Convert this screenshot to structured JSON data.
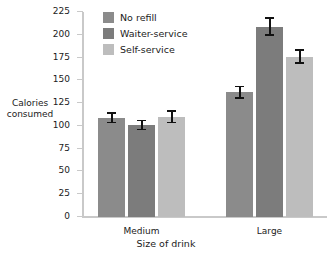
{
  "chart_data": {
    "type": "bar",
    "title": "",
    "xlabel": "Size of drink",
    "ylabel": "Calories consumed",
    "categories": [
      "Medium",
      "Large"
    ],
    "ylim": [
      0,
      225
    ],
    "yticks": [
      0,
      25,
      50,
      75,
      100,
      125,
      150,
      175,
      200,
      225
    ],
    "grid": false,
    "legend_position": "top-left-inside",
    "error_bars": "standard error",
    "series": [
      {
        "name": "No refill",
        "color": "#8b8b8b",
        "values": [
          109,
          137
        ],
        "errors": [
          6,
          7
        ]
      },
      {
        "name": "Waiter-service",
        "color": "#7c7c7c",
        "values": [
          101,
          209
        ],
        "errors": [
          6,
          10
        ]
      },
      {
        "name": "Self-service",
        "color": "#bdbdbd",
        "values": [
          110,
          176
        ],
        "errors": [
          7,
          8
        ]
      }
    ]
  },
  "axis": {
    "y_title_line1": "Calories",
    "y_title_line2": "consumed",
    "x_title": "Size of drink",
    "tick_labels": [
      "225",
      "200",
      "175",
      "150",
      "125",
      "100",
      "75",
      "50",
      "25",
      "0"
    ]
  },
  "legend": {
    "items": [
      {
        "label": "No refill",
        "color": "#8b8b8b"
      },
      {
        "label": "Waiter-service",
        "color": "#7c7c7c"
      },
      {
        "label": "Self-service",
        "color": "#bdbdbd"
      }
    ]
  },
  "group_labels": [
    "Medium",
    "Large"
  ]
}
